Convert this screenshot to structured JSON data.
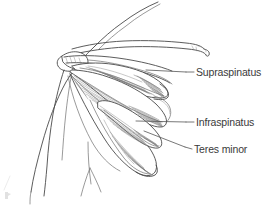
{
  "figure": {
    "background_color": "#ffffff",
    "line_color": "#4a4a4a",
    "text_color": "#3a3a3a",
    "width": 264,
    "height": 205
  },
  "labels": [
    {
      "id": "supraspinatus",
      "text": "Supraspinatus",
      "text_x": 196,
      "text_y": 76,
      "leader": "M186,72 L194,72",
      "pointer": "M146,70 L186,72"
    },
    {
      "id": "infraspinatus",
      "text": "Infraspinatus",
      "text_x": 196,
      "text_y": 126,
      "leader": "M186,122 L194,122",
      "pointer": "M134,121 L186,122"
    },
    {
      "id": "teres-minor",
      "text": "Teres minor",
      "text_x": 194,
      "text_y": 153,
      "leader": "M185,147 L192,149",
      "pointer": "M144,131 L185,147"
    }
  ],
  "anatomy": {
    "parts": [
      "arm-torso-outline",
      "clavicle",
      "scapular-spine",
      "acromion",
      "supraspinatus-muscle",
      "infraspinatus-muscle",
      "teres-minor-muscle",
      "scapula-body",
      "humerus-head"
    ]
  },
  "artifact": {
    "id": "corner-mark",
    "x": 6,
    "y": 193
  }
}
